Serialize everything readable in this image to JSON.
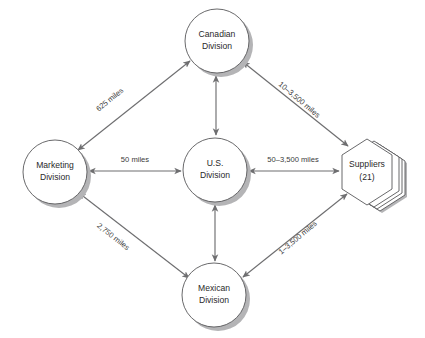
{
  "diagram": {
    "background_color": "#ffffff",
    "node_stroke_color": "#58585a",
    "node_fill_color": "#ffffff",
    "shadow_color": "#b4b4b6",
    "edge_color": "#6e6e70",
    "text_color": "#2a2a2a",
    "nodes": [
      {
        "id": "canadian",
        "shape": "circle",
        "line1": "Canadian",
        "line2": "Division",
        "cx": 217,
        "cy": 41,
        "r": 32
      },
      {
        "id": "marketing",
        "shape": "circle",
        "line1": "Marketing",
        "line2": "Division",
        "cx": 55,
        "cy": 172,
        "r": 32
      },
      {
        "id": "us",
        "shape": "circle",
        "line1": "U.S.",
        "line2": "Division",
        "cx": 215,
        "cy": 170,
        "r": 32
      },
      {
        "id": "mexican",
        "shape": "circle",
        "line1": "Mexican",
        "line2": "Division",
        "cx": 214,
        "cy": 295,
        "r": 32
      },
      {
        "id": "suppliers",
        "shape": "hexagon-stack",
        "line1": "Suppliers",
        "line2": "(21)",
        "cx": 367,
        "cy": 170,
        "r": 32
      }
    ],
    "edges": [
      {
        "id": "marketing-canadian",
        "from": "marketing",
        "to": "canadian",
        "label": "625 miles",
        "label_x": 110,
        "label_y": 100,
        "label_rotation": -39,
        "arrows": "both"
      },
      {
        "id": "canadian-suppliers",
        "from": "canadian",
        "to": "suppliers",
        "label": "10–3,500 miles",
        "label_x": 299,
        "label_y": 100,
        "label_rotation": 40,
        "arrows": "both"
      },
      {
        "id": "marketing-mexican",
        "from": "marketing",
        "to": "mexican",
        "label": "2,750 miles",
        "label_x": 113,
        "label_y": 237,
        "label_rotation": 38,
        "arrows": "both"
      },
      {
        "id": "mexican-suppliers",
        "from": "mexican",
        "to": "suppliers",
        "label": "1–3,500 miles",
        "label_x": 298,
        "label_y": 238,
        "label_rotation": -40,
        "arrows": "both"
      },
      {
        "id": "marketing-us",
        "from": "marketing",
        "to": "us",
        "label": "50 miles",
        "label_x": 135,
        "label_y": 160,
        "label_rotation": 0,
        "arrows": "both"
      },
      {
        "id": "us-suppliers",
        "from": "us",
        "to": "suppliers",
        "label": "50–3,500 miles",
        "label_x": 293,
        "label_y": 160,
        "label_rotation": 0,
        "arrows": "both"
      },
      {
        "id": "canadian-us",
        "from": "canadian",
        "to": "us",
        "label": "",
        "label_x": 0,
        "label_y": 0,
        "label_rotation": 0,
        "arrows": "both"
      },
      {
        "id": "us-mexican",
        "from": "us",
        "to": "mexican",
        "label": "",
        "label_x": 0,
        "label_y": 0,
        "label_rotation": 0,
        "arrows": "both"
      }
    ]
  }
}
